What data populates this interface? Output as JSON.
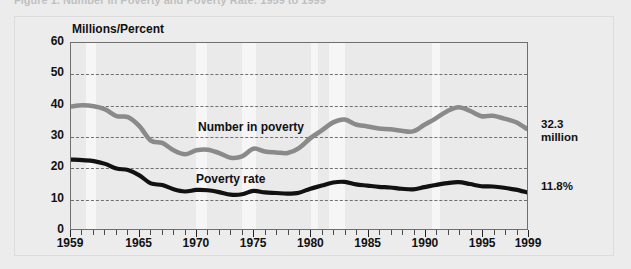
{
  "figure": {
    "title": "Figure 1. Number in Poverty and Poverty Rate: 1959 to 1999",
    "axis_title": "Millions/Percent"
  },
  "callouts": {
    "number_value": "32.3",
    "number_unit": "million",
    "rate_value": "11.8%"
  },
  "series_labels": {
    "number": "Number in poverty",
    "rate": "Poverty rate"
  },
  "colors": {
    "number_line": "#8a8a8a",
    "rate_line": "#111111",
    "background": "#ececed",
    "plot_background": "#eaeaeb",
    "recession_band": "#f6f6f7",
    "grid": "#6f6f70"
  },
  "chart_data": {
    "type": "line",
    "title": "Number in Poverty and Poverty Rate: 1959 to 1999",
    "xlabel": "",
    "ylabel": "Millions/Percent",
    "ylim": [
      0,
      60
    ],
    "xlim": [
      1959,
      1999
    ],
    "yticks": [
      0,
      10,
      20,
      30,
      40,
      50,
      60
    ],
    "xticks": [
      1959,
      1965,
      1970,
      1975,
      1980,
      1985,
      1990,
      1995,
      1999
    ],
    "grid": "horizontal-dashed",
    "legend": "inline-labels",
    "x": [
      1959,
      1960,
      1961,
      1962,
      1963,
      1964,
      1965,
      1966,
      1967,
      1968,
      1969,
      1970,
      1971,
      1972,
      1973,
      1974,
      1975,
      1976,
      1977,
      1978,
      1979,
      1980,
      1981,
      1982,
      1983,
      1984,
      1985,
      1986,
      1987,
      1988,
      1989,
      1990,
      1991,
      1992,
      1993,
      1994,
      1995,
      1996,
      1997,
      1998,
      1999
    ],
    "series": [
      {
        "name": "Number in poverty",
        "unit": "millions",
        "color": "#8a8a8a",
        "values": [
          39.5,
          39.9,
          39.6,
          38.6,
          36.4,
          36.1,
          33.2,
          28.5,
          27.8,
          25.4,
          24.1,
          25.4,
          25.6,
          24.5,
          23.0,
          23.4,
          25.9,
          25.0,
          24.7,
          24.5,
          26.1,
          29.3,
          31.8,
          34.4,
          35.3,
          33.7,
          33.1,
          32.4,
          32.2,
          31.7,
          31.5,
          33.6,
          35.7,
          38.0,
          39.3,
          38.1,
          36.4,
          36.5,
          35.6,
          34.5,
          32.3
        ]
      },
      {
        "name": "Poverty rate",
        "unit": "percent",
        "color": "#111111",
        "values": [
          22.4,
          22.2,
          21.9,
          21.0,
          19.5,
          19.0,
          17.3,
          14.7,
          14.2,
          12.8,
          12.1,
          12.6,
          12.5,
          11.9,
          11.1,
          11.2,
          12.3,
          11.8,
          11.6,
          11.4,
          11.7,
          13.0,
          14.0,
          15.0,
          15.2,
          14.4,
          14.0,
          13.6,
          13.4,
          13.0,
          12.8,
          13.5,
          14.2,
          14.8,
          15.1,
          14.5,
          13.8,
          13.7,
          13.3,
          12.7,
          11.8
        ]
      }
    ],
    "recession_bands": [
      [
        1960.3,
        1961.2
      ],
      [
        1969.9,
        1970.9
      ],
      [
        1973.9,
        1975.2
      ],
      [
        1980.0,
        1980.6
      ],
      [
        1981.5,
        1982.9
      ],
      [
        1990.5,
        1991.2
      ]
    ],
    "end_annotations": [
      {
        "series": "Number in poverty",
        "text": "32.3 million",
        "year": 1999
      },
      {
        "series": "Poverty rate",
        "text": "11.8%",
        "year": 1999
      }
    ]
  }
}
